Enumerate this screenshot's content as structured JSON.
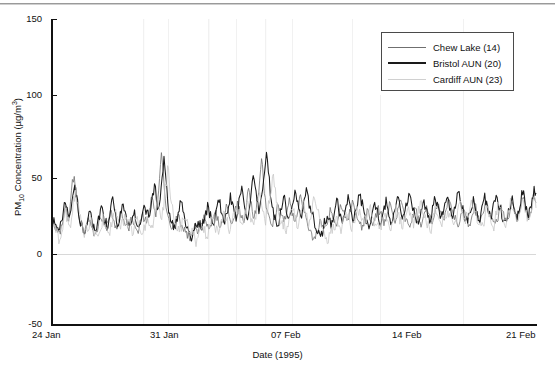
{
  "chart_data": {
    "type": "line",
    "title": "",
    "xlabel": "Date (1995)",
    "ylabel": "PM10 Concentration (µg/m³)",
    "ylabel_parts": {
      "prefix": "PM",
      "sub": "10",
      "mid": " Concentration (µg/m",
      "sup": "3",
      "suffix": ")"
    },
    "ylim": [
      -50,
      150
    ],
    "yticks": [
      150,
      100,
      50,
      0,
      -50
    ],
    "ytick_labels": [
      "150",
      "100",
      "50",
      "0",
      "-50"
    ],
    "xlim": [
      0,
      28
    ],
    "xticks": [
      0,
      7,
      14,
      21,
      28
    ],
    "xtick_labels": [
      "24 Jan",
      "31 Jan",
      "07 Feb",
      "14 Feb",
      "21 Feb"
    ],
    "grid": false,
    "zero_line": true,
    "legend_position": "top-right",
    "legend": [
      "Chew Lake (14)",
      "Bristol AUN (20)",
      "Cardiff AUN (23)"
    ],
    "x_unit": "days from 24 Jan 1995",
    "sampling": "approximately 4 samples per day",
    "series": [
      {
        "name": "Chew Lake (14)",
        "color": "#6f6f6f",
        "width": 0.8,
        "values": [
          14,
          16,
          13,
          11,
          10,
          14,
          20,
          27,
          22,
          17,
          30,
          44,
          48,
          38,
          24,
          17,
          14,
          12,
          13,
          16,
          19,
          15,
          12,
          10,
          12,
          16,
          21,
          18,
          14,
          12,
          16,
          22,
          26,
          20,
          15,
          13,
          18,
          24,
          21,
          17,
          14,
          12,
          15,
          19,
          16,
          13,
          12,
          14,
          18,
          22,
          19,
          16,
          20,
          28,
          34,
          26,
          20,
          30,
          45,
          63,
          50,
          34,
          24,
          18,
          15,
          13,
          16,
          20,
          24,
          19,
          15,
          12,
          10,
          8,
          7,
          9,
          12,
          15,
          13,
          11,
          14,
          18,
          22,
          18,
          15,
          13,
          16,
          20,
          24,
          20,
          16,
          14,
          18,
          23,
          28,
          24,
          19,
          16,
          20,
          26,
          31,
          26,
          21,
          18,
          22,
          30,
          38,
          32,
          25,
          20,
          24,
          33,
          44,
          57,
          46,
          33,
          25,
          20,
          17,
          15,
          18,
          24,
          30,
          26,
          21,
          17,
          20,
          26,
          32,
          27,
          22,
          18,
          22,
          28,
          34,
          29,
          24,
          20,
          16,
          12,
          9,
          7,
          8,
          11,
          15,
          19,
          16,
          13,
          16,
          21,
          26,
          22,
          18,
          15,
          18,
          23,
          28,
          24,
          20,
          17,
          20,
          25,
          30,
          26,
          22,
          18,
          15,
          13,
          16,
          20,
          25,
          21,
          17,
          14,
          17,
          22,
          27,
          23,
          19,
          16,
          19,
          24,
          29,
          25,
          21,
          18,
          21,
          26,
          31,
          27,
          23,
          19,
          16,
          14,
          17,
          21,
          26,
          22,
          18,
          15,
          18,
          23,
          28,
          24,
          20,
          17,
          20,
          25,
          30,
          26,
          22,
          19,
          22,
          27,
          32,
          28,
          24,
          20,
          17,
          15,
          18,
          22,
          27,
          23,
          19,
          16,
          19,
          24,
          29,
          25,
          21,
          18,
          21,
          26,
          31,
          27,
          23,
          20,
          17,
          15,
          18,
          23,
          28,
          24,
          20,
          17,
          20,
          26,
          32,
          27,
          23,
          19,
          22,
          28,
          34,
          29,
          24,
          20,
          23,
          29,
          35,
          30
        ]
      },
      {
        "name": "Bristol AUN (20)",
        "color": "#1a1a1a",
        "width": 1.05,
        "values": [
          16,
          20,
          17,
          14,
          12,
          17,
          24,
          31,
          26,
          20,
          26,
          36,
          40,
          33,
          22,
          16,
          13,
          12,
          15,
          20,
          25,
          19,
          15,
          12,
          15,
          21,
          27,
          22,
          17,
          14,
          20,
          28,
          34,
          26,
          19,
          15,
          22,
          30,
          26,
          21,
          17,
          14,
          18,
          24,
          20,
          16,
          14,
          17,
          23,
          28,
          24,
          19,
          25,
          35,
          42,
          32,
          24,
          33,
          48,
          58,
          44,
          30,
          22,
          17,
          14,
          13,
          18,
          24,
          30,
          23,
          18,
          14,
          11,
          9,
          8,
          11,
          15,
          19,
          16,
          13,
          17,
          23,
          28,
          22,
          18,
          15,
          20,
          26,
          31,
          25,
          20,
          17,
          22,
          29,
          35,
          29,
          23,
          19,
          25,
          33,
          40,
          33,
          26,
          21,
          27,
          37,
          47,
          39,
          30,
          24,
          30,
          41,
          52,
          64,
          50,
          36,
          27,
          21,
          18,
          16,
          20,
          27,
          34,
          29,
          23,
          19,
          23,
          30,
          37,
          31,
          25,
          20,
          25,
          32,
          39,
          33,
          27,
          22,
          18,
          14,
          11,
          9,
          10,
          13,
          18,
          23,
          19,
          15,
          19,
          25,
          31,
          26,
          21,
          17,
          21,
          27,
          33,
          28,
          23,
          19,
          23,
          29,
          35,
          30,
          25,
          21,
          17,
          15,
          19,
          24,
          30,
          25,
          20,
          16,
          20,
          26,
          32,
          27,
          22,
          18,
          22,
          28,
          34,
          29,
          24,
          20,
          24,
          30,
          36,
          31,
          26,
          22,
          18,
          16,
          20,
          25,
          31,
          26,
          21,
          17,
          21,
          27,
          33,
          28,
          23,
          19,
          23,
          29,
          35,
          30,
          25,
          21,
          25,
          31,
          37,
          32,
          27,
          23,
          19,
          17,
          21,
          26,
          32,
          27,
          22,
          18,
          22,
          28,
          34,
          29,
          24,
          20,
          24,
          30,
          36,
          31,
          26,
          22,
          19,
          17,
          21,
          27,
          33,
          28,
          23,
          19,
          23,
          30,
          37,
          31,
          26,
          21,
          25,
          32,
          40,
          34
        ]
      },
      {
        "name": "Cardiff AUN (23)",
        "color": "#c8c8c8",
        "width": 0.8,
        "values": [
          12,
          14,
          11,
          9,
          8,
          12,
          18,
          24,
          20,
          15,
          22,
          32,
          38,
          30,
          20,
          14,
          11,
          10,
          12,
          15,
          18,
          14,
          11,
          9,
          11,
          15,
          20,
          16,
          13,
          11,
          15,
          21,
          25,
          19,
          14,
          12,
          17,
          23,
          20,
          16,
          13,
          11,
          14,
          18,
          15,
          12,
          11,
          13,
          17,
          21,
          18,
          15,
          19,
          26,
          32,
          24,
          18,
          27,
          40,
          52,
          42,
          29,
          21,
          16,
          13,
          11,
          14,
          18,
          22,
          17,
          13,
          11,
          9,
          7,
          6,
          8,
          11,
          14,
          12,
          10,
          13,
          17,
          21,
          17,
          14,
          12,
          15,
          19,
          23,
          19,
          15,
          13,
          17,
          22,
          27,
          23,
          18,
          15,
          19,
          25,
          30,
          25,
          20,
          17,
          21,
          28,
          36,
          30,
          23,
          18,
          22,
          31,
          40,
          50,
          40,
          29,
          22,
          18,
          15,
          13,
          16,
          22,
          28,
          24,
          19,
          16,
          19,
          25,
          31,
          26,
          21,
          17,
          21,
          27,
          33,
          28,
          23,
          19,
          15,
          11,
          8,
          6,
          7,
          10,
          14,
          18,
          15,
          12,
          15,
          20,
          25,
          21,
          17,
          14,
          17,
          22,
          27,
          23,
          19,
          16,
          19,
          24,
          29,
          25,
          21,
          17,
          14,
          12,
          15,
          19,
          24,
          20,
          16,
          13,
          16,
          21,
          26,
          22,
          18,
          15,
          18,
          23,
          28,
          24,
          20,
          17,
          20,
          25,
          30,
          26,
          22,
          18,
          15,
          13,
          16,
          20,
          25,
          21,
          17,
          14,
          17,
          22,
          27,
          23,
          19,
          16,
          19,
          24,
          29,
          25,
          20,
          17,
          21,
          26,
          31,
          27,
          23,
          19,
          16,
          14,
          17,
          21,
          26,
          22,
          18,
          15,
          18,
          23,
          28,
          24,
          20,
          17,
          19,
          25,
          31,
          26,
          22,
          18,
          21,
          27,
          33,
          28,
          23,
          19,
          22,
          28,
          34,
          29
        ]
      }
    ],
    "annotations": {
      "peak_30jan": 63,
      "peak_08feb": 64,
      "peak_06feb": 57,
      "peak_25jan": 48
    }
  },
  "axes": {
    "y_title_prefix": "PM",
    "y_title_sub": "10",
    "y_title_mid": " Concentration (µg/m",
    "y_title_sup": "3",
    "y_title_suffix": ")",
    "x_title": "Date (1995)"
  },
  "legend": {
    "items": [
      {
        "label": "Chew Lake (14)",
        "swatch": "line-swatch-gray"
      },
      {
        "label": "Bristol AUN (20)",
        "swatch": "line-swatch-black"
      },
      {
        "label": "Cardiff AUN (23)",
        "swatch": "line-swatch-light"
      }
    ]
  }
}
